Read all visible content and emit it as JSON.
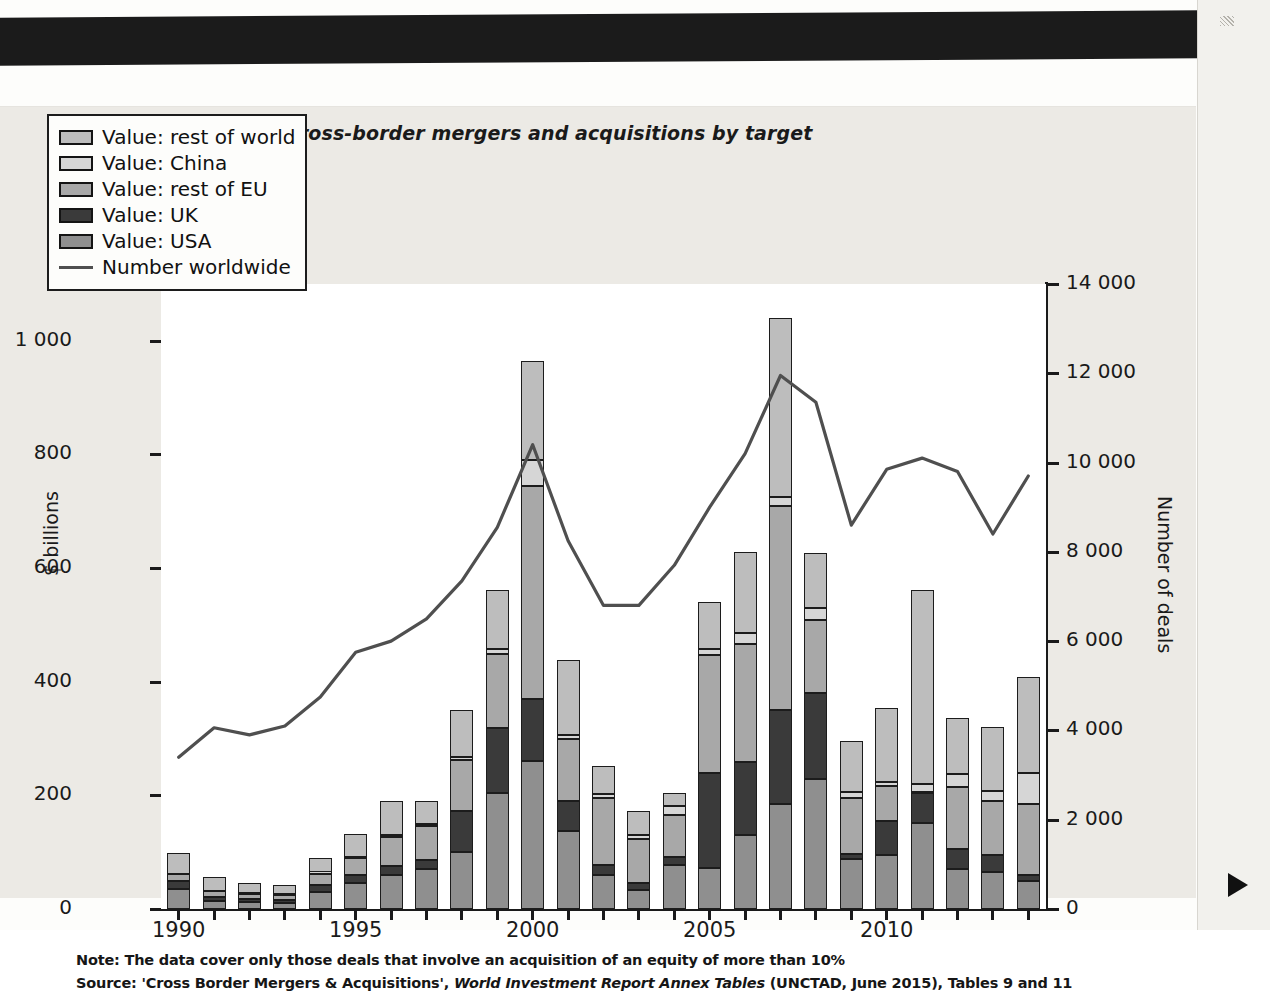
{
  "figure": {
    "title": "(a) Cross-border mergers and acquisitions by target",
    "note": "Note: The data cover only those deals that involve an acquisition of an equity of more than 10%",
    "source_prefix": "Source: 'Cross Border Mergers & Acquisitions', ",
    "source_italic": "World Investment Report Annex Tables",
    "source_suffix": " (UNCTAD, June 2015), Tables 9 and 11"
  },
  "legend": {
    "items": [
      {
        "label": "Value: rest of world",
        "color": "#bdbdbd",
        "type": "swatch"
      },
      {
        "label": "Value: China",
        "color": "#d6d6d6",
        "type": "swatch"
      },
      {
        "label": "Value: rest of EU",
        "color": "#a8a8a8",
        "type": "swatch"
      },
      {
        "label": "Value: UK",
        "color": "#3a3a3a",
        "type": "swatch"
      },
      {
        "label": "Value: USA",
        "color": "#8f8f8f",
        "type": "swatch"
      },
      {
        "label": "Number worldwide",
        "color": "#4f4f4f",
        "type": "line"
      }
    ]
  },
  "chart_data": {
    "type": "bar",
    "title": "(a) Cross-border mergers and acquisitions by target",
    "xlabel": "",
    "ylabel": "$ billions",
    "y2label": "Number of deals",
    "ylim": [
      0,
      1100
    ],
    "y2lim": [
      0,
      14000
    ],
    "yticks": [
      "0",
      "200",
      "400",
      "600",
      "800",
      "1 000"
    ],
    "ytick_values": [
      0,
      200,
      400,
      600,
      800,
      1000
    ],
    "y2ticks": [
      "0",
      "2 000",
      "4 000",
      "6 000",
      "8 000",
      "10 000",
      "12 000",
      "14 000"
    ],
    "y2tick_values": [
      0,
      2000,
      4000,
      6000,
      8000,
      10000,
      12000,
      14000
    ],
    "xticks": [
      "1990",
      "1995",
      "2000",
      "2005",
      "2010"
    ],
    "xtick_values": [
      1990,
      1995,
      2000,
      2005,
      2010
    ],
    "grid": false,
    "legend_position": "top-left",
    "stacked": true,
    "categories": [
      1990,
      1991,
      1992,
      1993,
      1994,
      1995,
      1996,
      1997,
      1998,
      1999,
      2000,
      2001,
      2002,
      2003,
      2004,
      2005,
      2006,
      2007,
      2008,
      2009,
      2010,
      2011,
      2012,
      2013,
      2014
    ],
    "series": [
      {
        "name": "Value: USA",
        "color": "#8f8f8f",
        "values": [
          36,
          14,
          12,
          10,
          30,
          45,
          60,
          70,
          100,
          205,
          260,
          138,
          60,
          34,
          78,
          73,
          130,
          185,
          228,
          88,
          95,
          152,
          70,
          65,
          50
        ]
      },
      {
        "name": "Value: UK",
        "color": "#3a3a3a",
        "values": [
          14,
          8,
          6,
          6,
          12,
          14,
          16,
          16,
          72,
          113,
          110,
          52,
          18,
          12,
          14,
          166,
          128,
          165,
          152,
          9,
          60,
          52,
          36,
          30,
          10
        ]
      },
      {
        "name": "Value: rest of EU",
        "color": "#a8a8a8",
        "values": [
          11,
          10,
          9,
          9,
          20,
          30,
          50,
          60,
          90,
          130,
          375,
          110,
          118,
          78,
          74,
          208,
          208,
          360,
          128,
          99,
          62,
          2,
          108,
          95,
          125
        ]
      },
      {
        "name": "Value: China",
        "color": "#d6d6d6",
        "values": [
          0,
          0,
          2,
          2,
          3,
          3,
          4,
          4,
          6,
          9,
          45,
          7,
          6,
          6,
          15,
          11,
          19,
          15,
          22,
          10,
          6,
          14,
          24,
          18,
          55
        ]
      },
      {
        "name": "Value: rest of world",
        "color": "#bdbdbd",
        "values": [
          37,
          24,
          16,
          16,
          25,
          40,
          60,
          40,
          82,
          105,
          175,
          132,
          50,
          42,
          24,
          82,
          143,
          315,
          96,
          90,
          131,
          341,
          99,
          112,
          168
        ]
      }
    ],
    "line_series": {
      "name": "Number worldwide",
      "axis": "y2",
      "color": "#4f4f4f",
      "values": [
        3400,
        4060,
        3900,
        4100,
        4750,
        5750,
        6000,
        6500,
        7350,
        8550,
        10400,
        8250,
        6800,
        6800,
        7700,
        9000,
        10200,
        11950,
        11350,
        8600,
        9850,
        10100,
        9800,
        8400,
        9700
      ]
    }
  }
}
